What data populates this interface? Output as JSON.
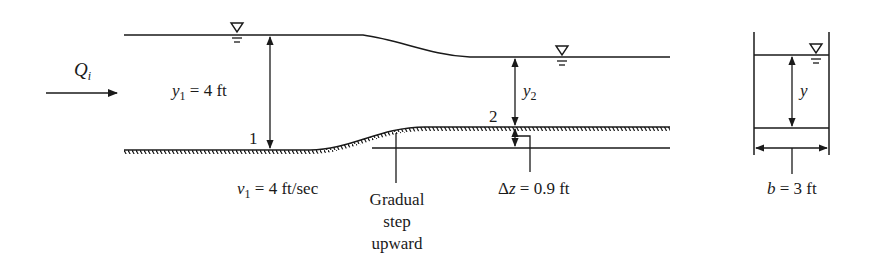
{
  "figure": {
    "type": "open-channel flow diagram",
    "profile_view": {
      "inflow": {
        "symbol": "Q",
        "subscript": "i",
        "arrow": "right-arrow"
      },
      "section_1": {
        "label": "1",
        "depth": {
          "symbol": "y",
          "subscript": "1",
          "value_text": "= 4 ft"
        },
        "velocity": {
          "symbol": "v",
          "subscript": "1",
          "value_text": "= 4 ft/sec"
        }
      },
      "section_2": {
        "label": "2",
        "depth": {
          "symbol": "y",
          "subscript": "2"
        }
      },
      "step": {
        "delta_symbol": "Δ",
        "var": "z",
        "value_text": "= 0.9 ft",
        "callout_lines": [
          "Gradual",
          "step",
          "upward"
        ]
      },
      "water_surface_symbol": "▽"
    },
    "cross_section": {
      "depth_symbol": "y",
      "width": {
        "symbol": "b",
        "value_text": "= 3 ft"
      },
      "water_surface_symbol": "▽"
    }
  },
  "colors": {
    "ink": "#1a1a1a",
    "background": "#ffffff"
  }
}
